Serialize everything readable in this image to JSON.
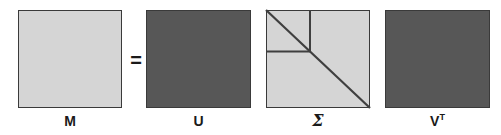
{
  "figure": {
    "background_color": "#ffffff",
    "width": 501,
    "height": 135
  },
  "colors": {
    "light_fill": "#d5d5d5",
    "dark_fill": "#575757",
    "border": "#3a3a3a",
    "line": "#3f3f3f",
    "text": "#1a1a1a"
  },
  "operators": [
    {
      "symbol": "=",
      "name": "equals-sign",
      "x": 128,
      "y": 50
    }
  ],
  "matrices": [
    {
      "id": "M",
      "label": "M",
      "name": "matrix-m",
      "fill": "light",
      "x": 18,
      "y": 10,
      "width": 104,
      "height": 98,
      "label_y": 112,
      "has_diagonal": false,
      "has_block_lines": false
    },
    {
      "id": "U",
      "label": "U",
      "name": "matrix-u",
      "fill": "dark",
      "x": 146,
      "y": 10,
      "width": 105,
      "height": 98,
      "label_y": 112,
      "has_diagonal": false,
      "has_block_lines": false
    },
    {
      "id": "Sigma",
      "label": "Σ",
      "name": "matrix-sigma",
      "fill": "light",
      "x": 266,
      "y": 10,
      "width": 104,
      "height": 98,
      "label_y": 111,
      "has_diagonal": true,
      "has_block_lines": true,
      "block_vertical_x": 44,
      "block_horizontal_y": 40
    },
    {
      "id": "VT",
      "label": "V",
      "label_superscript": "T",
      "name": "matrix-v-transpose",
      "fill": "dark",
      "x": 385,
      "y": 10,
      "width": 105,
      "height": 98,
      "label_y": 112,
      "has_diagonal": false,
      "has_block_lines": false
    }
  ]
}
